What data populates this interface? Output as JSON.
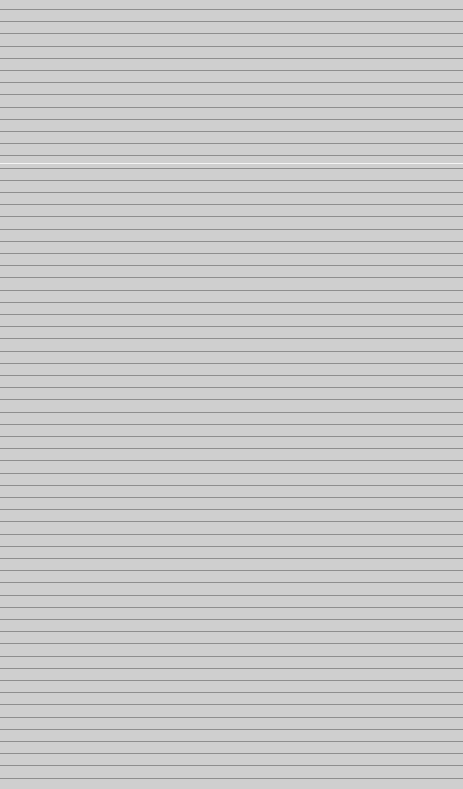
{
  "texture": {
    "kind": "lined-paper",
    "background_color": "#cfcfcf",
    "line_color": "#8e8e8e",
    "highlight_color": "#f4f4f4",
    "line_spacing_px": 12.2
  }
}
